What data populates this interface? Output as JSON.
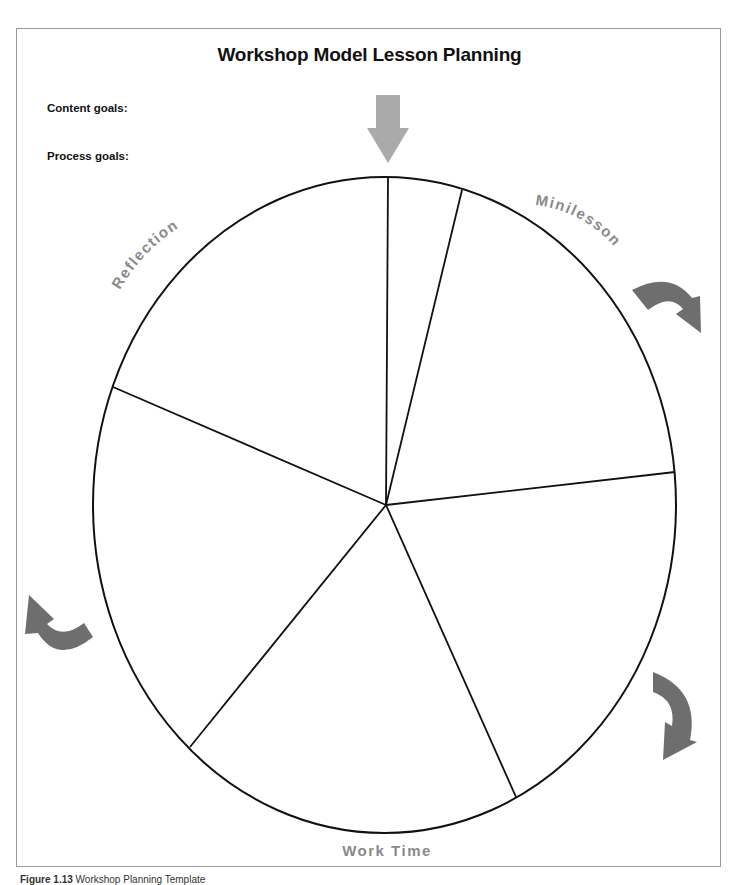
{
  "title": "Workshop Model Lesson Planning",
  "goals": {
    "content_label": "Content goals:",
    "process_label": "Process goals:"
  },
  "diagram": {
    "type": "segmented-circle",
    "segments": 6,
    "labels": {
      "minilesson": "Minilesson",
      "work_time": "Work Time",
      "reflection": "Reflection"
    },
    "arrows": [
      {
        "name": "start-arrow",
        "direction": "down",
        "color": "#aaaaaa"
      },
      {
        "name": "minilesson-curved-arrow",
        "direction": "clockwise",
        "color": "#6e6e6e"
      },
      {
        "name": "work-time-curved-arrow",
        "direction": "clockwise",
        "color": "#6e6e6e"
      },
      {
        "name": "reflection-curved-arrow",
        "direction": "clockwise",
        "color": "#6e6e6e"
      }
    ],
    "colors": {
      "outline": "#111111",
      "label_gray": "#8a8a8a",
      "frame": "#9a9a9a"
    }
  },
  "caption": {
    "figure_number": "Figure 1.13",
    "text": "Workshop Planning Template"
  }
}
